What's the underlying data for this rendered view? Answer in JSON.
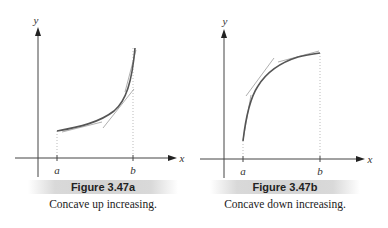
{
  "figures": [
    {
      "id": "a",
      "title": "Figure 3.47a",
      "caption": "Concave up increasing.",
      "x_axis_label": "x",
      "y_axis_label": "y",
      "tick_labels": [
        "a",
        "b"
      ]
    },
    {
      "id": "b",
      "title": "Figure 3.47b",
      "caption": "Concave down increasing.",
      "x_axis_label": "x",
      "y_axis_label": "y",
      "tick_labels": [
        "a",
        "b"
      ]
    }
  ],
  "colors": {
    "axis": "#333333",
    "curve": "#555555",
    "tangent": "#9a9a9a",
    "guide": "#bbbbbb",
    "caption_bar": "#d6d6d6"
  }
}
